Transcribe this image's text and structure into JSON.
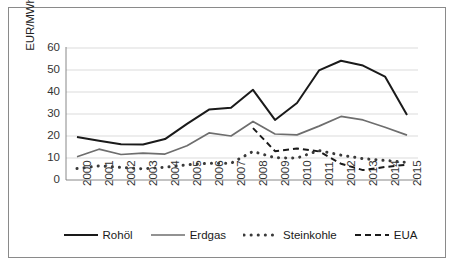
{
  "chart_data": {
    "type": "line",
    "title": "",
    "subtitle": "",
    "xlabel": "",
    "ylabel": "EUR/MWh_th bzw. EUR/t CO2",
    "ylabel_parts": {
      "main_1": "EUR/MWh",
      "sub_1": "th",
      "main_2": " bzw. EUR/t CO",
      "sub_2": "2"
    },
    "x": [
      2000,
      2001,
      2002,
      2003,
      2004,
      2005,
      2006,
      2007,
      2008,
      2009,
      2010,
      2011,
      2012,
      2013,
      2014,
      2015
    ],
    "categories": [
      "2000",
      "2001",
      "2002",
      "2003",
      "2004",
      "2005",
      "2006",
      "2007",
      "2008",
      "2009",
      "2010",
      "2011",
      "2012",
      "2013",
      "2014",
      "2015"
    ],
    "ylim": [
      0,
      60
    ],
    "yticks": [
      0,
      10,
      20,
      30,
      40,
      50,
      60
    ],
    "ytick_labels": [
      "0",
      "10",
      "20",
      "30",
      "40",
      "50",
      "60"
    ],
    "grid": true,
    "grid_axis": "y",
    "legend_position": "bottom",
    "series": [
      {
        "name": "Rohöl",
        "style": "solid",
        "color": "#1a1a1a",
        "width": 2.0,
        "values": [
          19.5,
          17.8,
          16.2,
          16.1,
          18.6,
          25.5,
          32.0,
          32.8,
          41.0,
          27.3,
          35.0,
          49.8,
          54.2,
          52.0,
          47.0,
          29.5
        ]
      },
      {
        "name": "Erdgas",
        "style": "solid",
        "color": "#6e6e6e",
        "width": 1.7,
        "values": [
          10.6,
          14.0,
          11.6,
          12.2,
          11.8,
          15.6,
          21.4,
          20.0,
          26.6,
          20.9,
          20.5,
          24.5,
          28.9,
          27.3,
          24.0,
          20.4
        ]
      },
      {
        "name": "Steinkohle",
        "style": "dotted",
        "color": "#3a3a3a",
        "width": 3.0,
        "values": [
          5.2,
          6.4,
          5.7,
          5.1,
          5.8,
          6.9,
          7.6,
          7.6,
          13.0,
          10.1,
          10.0,
          13.4,
          11.3,
          9.7,
          8.9,
          8.0
        ]
      },
      {
        "name": "EUA",
        "style": "dashed",
        "color": "#1a1a1a",
        "width": 2.0,
        "values": [
          null,
          null,
          null,
          null,
          null,
          null,
          null,
          null,
          23.6,
          13.1,
          14.3,
          13.0,
          7.4,
          4.5,
          5.9,
          7.0
        ]
      }
    ]
  },
  "legend": {
    "items": [
      {
        "label": "Rohöl",
        "swatch": "solid-black-line"
      },
      {
        "label": "Erdgas",
        "swatch": "solid-gray-line"
      },
      {
        "label": "Steinkohle",
        "swatch": "dotted-line"
      },
      {
        "label": "EUA",
        "swatch": "dashed-line"
      }
    ]
  },
  "colors": {
    "rohoel": "#1a1a1a",
    "erdgas": "#6e6e6e",
    "steinkohle": "#3a3a3a",
    "eua": "#1a1a1a",
    "grid": "#d2d2d2",
    "axis": "#7a7a7a",
    "frame": "#8a8a8a",
    "background": "#ffffff"
  }
}
